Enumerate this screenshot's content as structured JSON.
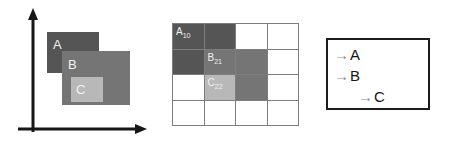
{
  "figure": {
    "panels": [
      "axes-rectangles",
      "grid",
      "arrow-list"
    ]
  },
  "colors": {
    "background": "#ffffff",
    "axis": "#161616",
    "rect_a_fill": "#555555",
    "rect_b_fill": "#757575",
    "rect_c_fill": "#b8b8b8",
    "grid_line": "#7d7d7d",
    "cell_dark": "#555555",
    "cell_medium": "#757575",
    "cell_light": "#b8b8b8",
    "cell_empty": "#ffffff",
    "label_text": "#f2f2f2",
    "box_border": "#1c1c1c",
    "arrow": "#8c8c8c",
    "letter": "#161616"
  },
  "panel_axes": {
    "x_axis_label": "",
    "y_axis_label": "",
    "rectangles": [
      {
        "id": "A",
        "label": "A",
        "fill": "#555555"
      },
      {
        "id": "B",
        "label": "B",
        "fill": "#757575"
      },
      {
        "id": "C",
        "label": "C",
        "fill": "#b8b8b8"
      }
    ]
  },
  "panel_grid": {
    "rows": 4,
    "cols": 4,
    "cells": [
      [
        {
          "fill": "#555555",
          "label": "A",
          "sub": "10"
        },
        {
          "fill": "#555555",
          "label": "",
          "sub": ""
        },
        {
          "fill": "#ffffff",
          "label": "",
          "sub": ""
        },
        {
          "fill": "#ffffff",
          "label": "",
          "sub": ""
        }
      ],
      [
        {
          "fill": "#555555",
          "label": "",
          "sub": ""
        },
        {
          "fill": "#757575",
          "label": "B",
          "sub": "21"
        },
        {
          "fill": "#757575",
          "label": "",
          "sub": ""
        },
        {
          "fill": "#ffffff",
          "label": "",
          "sub": ""
        }
      ],
      [
        {
          "fill": "#ffffff",
          "label": "",
          "sub": ""
        },
        {
          "fill": "#b8b8b8",
          "label": "C",
          "sub": "22"
        },
        {
          "fill": "#757575",
          "label": "",
          "sub": ""
        },
        {
          "fill": "#ffffff",
          "label": "",
          "sub": ""
        }
      ],
      [
        {
          "fill": "#ffffff",
          "label": "",
          "sub": ""
        },
        {
          "fill": "#ffffff",
          "label": "",
          "sub": ""
        },
        {
          "fill": "#ffffff",
          "label": "",
          "sub": ""
        },
        {
          "fill": "#ffffff",
          "label": "",
          "sub": ""
        }
      ]
    ]
  },
  "panel_list": {
    "arrow_icon": "→",
    "rows": [
      {
        "arrow": "→",
        "letter": "A",
        "indent": 0
      },
      {
        "arrow": "→",
        "letter": "B",
        "indent": 0
      },
      {
        "arrow": "→",
        "letter": "C",
        "indent": 1
      }
    ]
  }
}
